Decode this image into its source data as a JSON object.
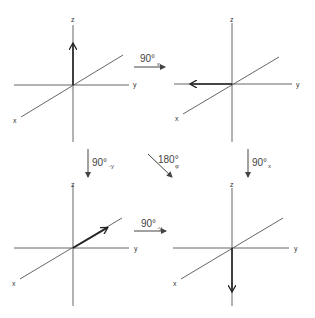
{
  "figures": [
    {
      "id": "top-left",
      "axis_labels": {
        "x": "x",
        "y": "y",
        "z": "z"
      },
      "vector_direction": "+z"
    },
    {
      "id": "top-right",
      "axis_labels": {
        "x": "x",
        "y": "y",
        "z": "z"
      },
      "vector_direction": "-y"
    },
    {
      "id": "bottom-left",
      "axis_labels": {
        "x": "x",
        "y": "y",
        "z": "z"
      },
      "vector_direction": "-x"
    },
    {
      "id": "bottom-right",
      "axis_labels": {
        "x": "x",
        "y": "y",
        "z": "z"
      },
      "vector_direction": "-z"
    }
  ],
  "rotations": {
    "top": {
      "angle": "90°",
      "axis": "x"
    },
    "left": {
      "angle": "90°",
      "axis": "-y"
    },
    "diagonal": {
      "angle": "180°",
      "axis": "φ"
    },
    "right": {
      "angle": "90°",
      "axis": "x"
    },
    "bottom": {
      "angle": "90°",
      "axis": "-y"
    }
  }
}
